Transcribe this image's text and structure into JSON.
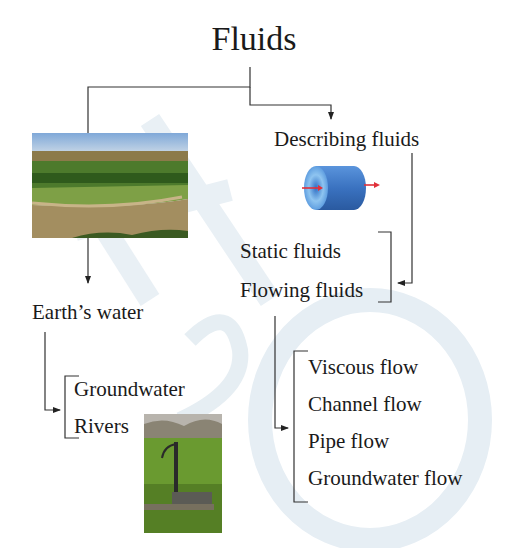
{
  "title": "Fluids",
  "branches": {
    "earths_water": {
      "label": "Earth’s water",
      "image": "river-landscape-photo",
      "children": [
        "Groundwater",
        "Rivers"
      ],
      "child_image": "hand-water-pump-photo"
    },
    "describing_fluids": {
      "label": "Describing fluids",
      "image": "pipe-flow-cylinder-icon",
      "children": [
        "Static fluids",
        "Flowing fluids"
      ],
      "flowing_children": [
        "Viscous flow",
        "Channel flow",
        "Pipe flow",
        "Groundwater flow"
      ]
    }
  },
  "watermark": "H2O",
  "colors": {
    "text": "#1a1a1a",
    "line": "#333333",
    "watermark": "#e6eef4",
    "cylinder": "#3a78c8",
    "arrow_red": "#e0303a"
  }
}
